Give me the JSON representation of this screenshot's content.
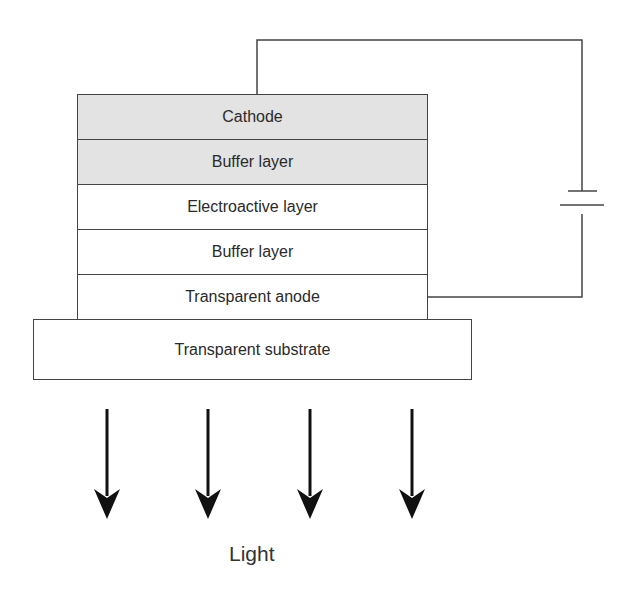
{
  "diagram": {
    "layers": [
      {
        "label": "Cathode",
        "fill": "#e3e3e3"
      },
      {
        "label": "Buffer layer",
        "fill": "#e3e3e3"
      },
      {
        "label": "Electroactive layer",
        "fill": "#ffffff"
      },
      {
        "label": "Buffer layer",
        "fill": "#ffffff"
      },
      {
        "label": "Transparent anode",
        "fill": "#ffffff"
      }
    ],
    "substrate": {
      "label": "Transparent substrate"
    },
    "power_source": {
      "symbol": "battery-icon"
    },
    "emission": {
      "label": "Light",
      "arrow_count": 4,
      "direction": "down"
    }
  }
}
